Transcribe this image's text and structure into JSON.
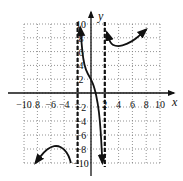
{
  "chart_data": {
    "type": "line",
    "title": "",
    "xlabel": "x",
    "ylabel": "y",
    "xlim": [
      -10,
      10
    ],
    "ylim": [
      -10,
      10
    ],
    "grid": true,
    "x_ticks": [
      -10,
      -8,
      -6,
      -4,
      -2,
      2,
      4,
      6,
      8,
      10
    ],
    "y_ticks": [
      10,
      8,
      6,
      4,
      2,
      -2,
      -4,
      -6,
      -8,
      -10
    ],
    "x_tick_labels": [
      "−10",
      "8",
      "−6",
      "−4",
      "−",
      "2",
      "4",
      "6",
      "8",
      "10"
    ],
    "y_tick_labels": [
      "10",
      "8",
      "6",
      "4",
      "2",
      "−2",
      "−4",
      "−6",
      "−8",
      "−10"
    ],
    "asymptotes": [
      {
        "type": "vertical",
        "x": -2,
        "style": "dashed"
      },
      {
        "type": "vertical",
        "x": 2,
        "style": "dashed"
      }
    ],
    "series": [
      {
        "name": "left-branch",
        "points": [
          [
            -8.3,
            -10
          ],
          [
            -7,
            -8.4
          ],
          [
            -6,
            -7.7
          ],
          [
            -5,
            -7.5
          ],
          [
            -4,
            -8.0
          ],
          [
            -3.3,
            -9.0
          ],
          [
            -3,
            -10
          ]
        ],
        "arrow_start": true,
        "arrow_end": false
      },
      {
        "name": "middle-branch",
        "points": [
          [
            -1.6,
            9.5
          ],
          [
            -1.3,
            6
          ],
          [
            -1,
            4
          ],
          [
            -0.5,
            2.8
          ],
          [
            0,
            2
          ],
          [
            0.5,
            0.8
          ],
          [
            1,
            -1.5
          ],
          [
            1.3,
            -4
          ],
          [
            1.5,
            -7
          ],
          [
            1.65,
            -10
          ]
        ],
        "arrow_start": true,
        "arrow_end": true
      },
      {
        "name": "right-branch",
        "points": [
          [
            2.3,
            8.8
          ],
          [
            2.8,
            7.2
          ],
          [
            3.5,
            6.8
          ],
          [
            4.5,
            6.8
          ],
          [
            6,
            7.5
          ],
          [
            7,
            8.3
          ],
          [
            8,
            9.2
          ]
        ],
        "arrow_start": true,
        "arrow_end": true
      }
    ]
  }
}
